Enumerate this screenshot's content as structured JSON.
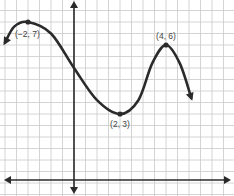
{
  "chart_data": {
    "type": "line",
    "title": "",
    "xlabel": "",
    "ylabel": "",
    "grid": true,
    "grid_step": 0.5,
    "xlim": [
      -3.2,
      6.9
    ],
    "ylim": [
      -0.2,
      8.0
    ],
    "axes_arrows": true,
    "series": [
      {
        "name": "f(x)",
        "start_arrow": true,
        "end_arrow": true,
        "points": [
          {
            "x": -3.0,
            "y": 6.1
          },
          {
            "x": -2.6,
            "y": 6.8
          },
          {
            "x": -2.0,
            "y": 7.0
          },
          {
            "x": -1.0,
            "y": 6.5
          },
          {
            "x": 0.0,
            "y": 5.0
          },
          {
            "x": 1.0,
            "y": 3.6
          },
          {
            "x": 2.0,
            "y": 3.0
          },
          {
            "x": 2.8,
            "y": 3.6
          },
          {
            "x": 3.4,
            "y": 5.2
          },
          {
            "x": 4.0,
            "y": 6.0
          },
          {
            "x": 4.6,
            "y": 5.2
          },
          {
            "x": 5.1,
            "y": 3.7
          }
        ]
      }
    ],
    "annotations": [
      {
        "x": -2,
        "y": 7,
        "text": "(−2, 7)",
        "position": "below-right"
      },
      {
        "x": 2,
        "y": 3,
        "text": "(2, 3)",
        "position": "below"
      },
      {
        "x": 4,
        "y": 6,
        "text": "(4, 6)",
        "position": "above"
      }
    ]
  }
}
